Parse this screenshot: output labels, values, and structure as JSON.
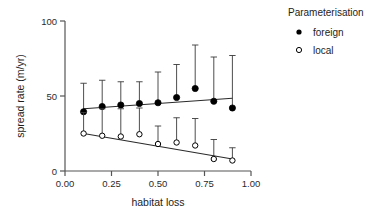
{
  "chart_data": {
    "type": "scatter",
    "title": "",
    "xlabel": "habitat loss",
    "ylabel": "spread rate (m/yr)",
    "xlim": [
      0.0,
      1.0
    ],
    "ylim": [
      0,
      100
    ],
    "grid": false,
    "xticks": [
      "0.00",
      "0.25",
      "0.50",
      "0.75",
      "1.00"
    ],
    "xtick_values": [
      0.0,
      0.25,
      0.5,
      0.75,
      1.0
    ],
    "yticks": [
      "0",
      "50",
      "100"
    ],
    "ytick_values": [
      0,
      50,
      100
    ],
    "legend": {
      "title": "Parameterisation",
      "position": "right",
      "entries": [
        {
          "label": "foreign",
          "marker": "filled-circle",
          "color": "#000000"
        },
        {
          "label": "local",
          "marker": "open-circle",
          "color": "#000000"
        }
      ]
    },
    "x": [
      0.1,
      0.2,
      0.3,
      0.4,
      0.5,
      0.6,
      0.7,
      0.8,
      0.9
    ],
    "series": [
      {
        "name": "foreign",
        "marker": "filled-circle",
        "values": [
          39.5,
          43.0,
          44.0,
          45.0,
          45.5,
          49.0,
          55.0,
          46.5,
          42.0
        ],
        "err_upper": [
          58.5,
          60.5,
          59.5,
          59.5,
          66.0,
          71.0,
          84.0,
          76.0,
          77.0
        ],
        "err_lower": [
          39.5,
          43.0,
          44.0,
          45.0,
          45.5,
          49.0,
          55.0,
          46.5,
          42.0
        ],
        "fit_line": {
          "x0": 0.1,
          "y0": 41.5,
          "x1": 0.9,
          "y1": 48.5
        }
      },
      {
        "name": "local",
        "marker": "open-circle",
        "values": [
          25.0,
          23.5,
          23.0,
          24.5,
          18.0,
          19.0,
          17.0,
          8.0,
          7.0
        ],
        "err_upper": [
          39.0,
          41.5,
          41.5,
          42.0,
          30.0,
          35.5,
          35.0,
          21.0,
          15.5
        ],
        "err_lower": [
          25.0,
          23.5,
          23.0,
          24.5,
          18.0,
          19.0,
          17.0,
          8.0,
          7.0
        ],
        "fit_line": {
          "x0": 0.1,
          "y0": 25.0,
          "x1": 0.9,
          "y1": 8.0
        }
      }
    ]
  }
}
